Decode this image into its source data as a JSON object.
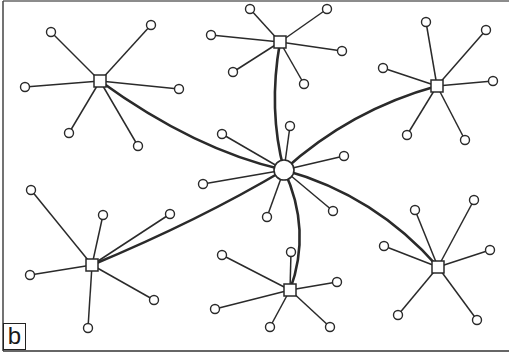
{
  "figure": {
    "panel_label": "b",
    "colors": {
      "stroke": "#2a2a2a",
      "background": "#ffffff"
    },
    "center_hub": {
      "id": "C",
      "shape": "circle",
      "x": 284,
      "y": 170,
      "r": 10,
      "leaves": [
        [
          222,
          134
        ],
        [
          290,
          126
        ],
        [
          344,
          156
        ],
        [
          203,
          184
        ],
        [
          333,
          211
        ],
        [
          267,
          217
        ]
      ]
    },
    "hubs": [
      {
        "id": "TL",
        "shape": "square",
        "x": 100,
        "y": 81,
        "leaves": [
          [
            51,
            32
          ],
          [
            151,
            25
          ],
          [
            25,
            87
          ],
          [
            179,
            89
          ],
          [
            69,
            133
          ],
          [
            138,
            146
          ]
        ],
        "link_ctrl": [
          195,
          150
        ]
      },
      {
        "id": "TC",
        "shape": "square",
        "x": 280,
        "y": 42,
        "leaves": [
          [
            250,
            9
          ],
          [
            327,
            9
          ],
          [
            211,
            35
          ],
          [
            342,
            51
          ],
          [
            233,
            72
          ],
          [
            304,
            84
          ]
        ],
        "link_ctrl": [
          268,
          110
        ]
      },
      {
        "id": "TR",
        "shape": "square",
        "x": 437,
        "y": 86,
        "leaves": [
          [
            426,
            22
          ],
          [
            486,
            30
          ],
          [
            383,
            68
          ],
          [
            493,
            81
          ],
          [
            407,
            135
          ],
          [
            465,
            140
          ]
        ],
        "link_ctrl": [
          350,
          110
        ]
      },
      {
        "id": "BL",
        "shape": "square",
        "x": 92,
        "y": 265,
        "leaves": [
          [
            31,
            190
          ],
          [
            103,
            215
          ],
          [
            170,
            214
          ],
          [
            30,
            275
          ],
          [
            154,
            300
          ],
          [
            88,
            328
          ]
        ],
        "link_ctrl": [
          200,
          220
        ]
      },
      {
        "id": "BC",
        "shape": "square",
        "x": 290,
        "y": 290,
        "leaves": [
          [
            222,
            255
          ],
          [
            291,
            252
          ],
          [
            337,
            282
          ],
          [
            215,
            309
          ],
          [
            270,
            327
          ],
          [
            330,
            327
          ]
        ],
        "link_ctrl": [
          312,
          230
        ]
      },
      {
        "id": "BR",
        "shape": "square",
        "x": 438,
        "y": 267,
        "leaves": [
          [
            415,
            210
          ],
          [
            474,
            200
          ],
          [
            384,
            246
          ],
          [
            490,
            250
          ],
          [
            398,
            315
          ],
          [
            477,
            320
          ]
        ],
        "link_ctrl": [
          375,
          195
        ]
      }
    ]
  }
}
